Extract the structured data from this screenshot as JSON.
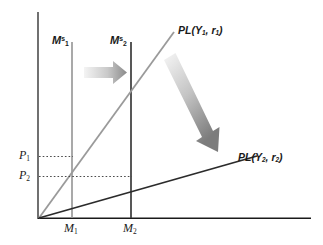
{
  "figure": {
    "kind": "economics-money-market-price-level-diagram",
    "background_color": "#ffffff"
  },
  "axes": {
    "y_axis": {
      "name": "vertical-axis",
      "color": "#4d4d4d"
    },
    "x_axis": {
      "name": "horizontal-axis",
      "color": "#1a1a1a"
    },
    "origin_label": ""
  },
  "y_ticks": [
    {
      "label": "P",
      "sub": "1",
      "value_y": 156
    },
    {
      "label": "P",
      "sub": "2",
      "value_y": 176
    }
  ],
  "x_ticks": [
    {
      "label": "M",
      "sub": "1",
      "value_x": 72
    },
    {
      "label": "M",
      "sub": "2",
      "value_x": 131
    }
  ],
  "money_supply_lines": [
    {
      "name": "money-supply-1",
      "label": "M",
      "sub": "1",
      "sup": "s",
      "x": 72,
      "color": "#9a9a9a"
    },
    {
      "name": "money-supply-2",
      "label": "M",
      "sub": "2",
      "sup": "s",
      "x": 131,
      "color": "#333333"
    }
  ],
  "curves": [
    {
      "name": "pl-curve-1",
      "label_text": "PL(Y",
      "label_sub1": "1",
      "label_mid": ", r",
      "label_sub2": "1",
      "label_end": ")",
      "color": "#9a9a9a",
      "description": "steep upward sloping price level curve"
    },
    {
      "name": "pl-curve-2",
      "label_text": "PL(Y",
      "label_sub1": "2",
      "label_mid": ", r",
      "label_sub2": "2",
      "label_end": ")",
      "color": "#2b2b2b",
      "description": "shallow upward sloping price level curve"
    }
  ],
  "arrows": [
    {
      "name": "shift-right-arrow",
      "direction": "right",
      "gradient_from": "#f2f2f2",
      "gradient_to": "#8c8c8c"
    },
    {
      "name": "shift-down-arrow",
      "direction": "down-right",
      "gradient_from": "#f2f2f2",
      "gradient_to": "#7a7a7a"
    }
  ],
  "dotted_lines": [
    {
      "name": "price-1-guide",
      "from_y": 156,
      "to_x": 72
    },
    {
      "name": "price-2-guide",
      "from_y": 176,
      "to_x": 131
    }
  ],
  "colors": {
    "dark_line": "#2b2b2b",
    "light_line": "#9a9a9a",
    "axis": "#4d4d4d",
    "dotted": "#4d4d4d"
  }
}
